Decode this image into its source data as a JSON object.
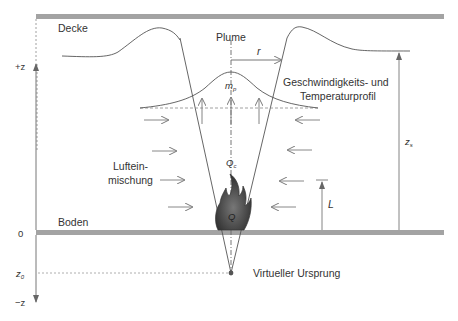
{
  "diagram": {
    "labels": {
      "ceiling": "Decke",
      "floor": "Boden",
      "plume": "Plume",
      "radius": "r",
      "mass_flow": "m",
      "mass_flow_sub": "p",
      "profile_line1": "Geschwindigkeits- und",
      "profile_line2": "Temperaturprofil",
      "entrainment_line1": "Luftein-",
      "entrainment_line2": "mischung",
      "convective_heat": "Q",
      "convective_heat_sub": "c",
      "heat_release": "Q",
      "flame_height": "L",
      "height_total": "z",
      "height_total_sub": "s",
      "virtual_origin": "Virtueller Ursprung"
    },
    "axis": {
      "positive": "+z",
      "zero": "0",
      "origin": "z",
      "origin_sub": "0",
      "negative": "−z"
    },
    "colors": {
      "surface": "#a3a3a3",
      "line": "#555555",
      "arrow": "#7a7a7a",
      "flame": "#4a4a4a",
      "text": "#333333"
    }
  }
}
